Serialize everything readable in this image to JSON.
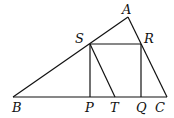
{
  "diagram": {
    "type": "geometry",
    "points": {
      "A": {
        "label": "A",
        "x": 128,
        "y": 17
      },
      "B": {
        "label": "B",
        "x": 13,
        "y": 97
      },
      "C": {
        "label": "C",
        "x": 167,
        "y": 97
      },
      "S": {
        "label": "S",
        "x": 90,
        "y": 44
      },
      "R": {
        "label": "R",
        "x": 141,
        "y": 44
      },
      "P": {
        "label": "P",
        "x": 90,
        "y": 97
      },
      "Q": {
        "label": "Q",
        "x": 141,
        "y": 97
      },
      "T": {
        "label": "T",
        "x": 115,
        "y": 97
      }
    },
    "segments": [
      "AB",
      "AC",
      "BC",
      "SR",
      "SP",
      "RQ",
      "ST"
    ]
  }
}
